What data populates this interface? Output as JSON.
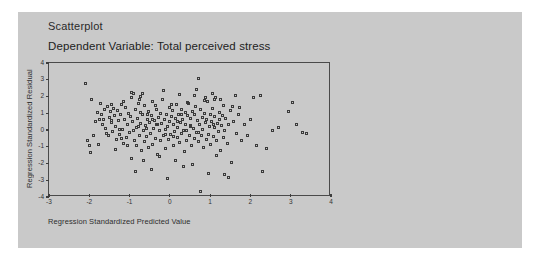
{
  "card": {
    "background": "#c9c9c9",
    "title": "Scatterplot",
    "subtitle": "Dependent Variable: Total perceived stress"
  },
  "chart_data": {
    "type": "scatter",
    "title": "Scatterplot",
    "subtitle": "Dependent Variable: Total perceived stress",
    "xlabel": "Regression Standardized Predicted Value",
    "ylabel": "Regression Standardized Residual",
    "xlim": [
      -3,
      4
    ],
    "ylim": [
      -4,
      4
    ],
    "xticks": [
      -3,
      -2,
      -1,
      0,
      1,
      2,
      3,
      4
    ],
    "yticks": [
      4,
      3,
      2,
      1,
      0,
      -1,
      -2,
      -3,
      -4
    ],
    "xtick_labels": [
      "-3",
      "-2",
      "-1",
      "0",
      "1",
      "2",
      "3",
      "4"
    ],
    "ytick_labels": [
      "4",
      "3",
      "2",
      "1",
      "0",
      "-1",
      "-2",
      "-3",
      "-4"
    ],
    "grid": false,
    "legend": false,
    "marker": "open-square",
    "marker_color": "#3a3a3a",
    "points": [
      [
        -2.1,
        2.8
      ],
      [
        -1.95,
        1.8
      ],
      [
        -1.8,
        1.05
      ],
      [
        -1.75,
        0.6
      ],
      [
        -1.7,
        0.95
      ],
      [
        -1.68,
        0.3
      ],
      [
        -1.62,
        1.25
      ],
      [
        -1.6,
        0.1
      ],
      [
        -1.55,
        1.4
      ],
      [
        -1.52,
        -0.35
      ],
      [
        -1.5,
        0.75
      ],
      [
        -1.48,
        1.1
      ],
      [
        -1.45,
        0.45
      ],
      [
        -1.42,
        -0.1
      ],
      [
        -1.4,
        1.3
      ],
      [
        -1.38,
        0.85
      ],
      [
        -1.35,
        0.2
      ],
      [
        -1.32,
        -0.55
      ],
      [
        -1.3,
        1.15
      ],
      [
        -1.28,
        0.55
      ],
      [
        -1.25,
        -0.25
      ],
      [
        -1.22,
        0.95
      ],
      [
        -1.2,
        1.55
      ],
      [
        -1.18,
        0.05
      ],
      [
        -1.15,
        -0.8
      ],
      [
        -1.12,
        0.65
      ],
      [
        -1.1,
        1.35
      ],
      [
        -1.08,
        -0.45
      ],
      [
        -1.05,
        0.35
      ],
      [
        -1.02,
        1.0
      ],
      [
        -1.0,
        -0.15
      ],
      [
        -0.98,
        0.8
      ],
      [
        -0.96,
        1.95
      ],
      [
        -0.95,
        -1.7
      ],
      [
        -0.92,
        0.5
      ],
      [
        -0.9,
        2.15
      ],
      [
        -0.88,
        -0.6
      ],
      [
        -0.86,
        1.2
      ],
      [
        -0.84,
        0.15
      ],
      [
        -0.82,
        -0.95
      ],
      [
        -0.8,
        0.7
      ],
      [
        -0.78,
        1.6
      ],
      [
        -0.76,
        -0.3
      ],
      [
        -0.74,
        0.4
      ],
      [
        -0.72,
        1.05
      ],
      [
        -0.7,
        -1.25
      ],
      [
        -0.68,
        0.9
      ],
      [
        -0.66,
        0.0
      ],
      [
        -0.64,
        -0.7
      ],
      [
        -0.62,
        1.45
      ],
      [
        -0.6,
        0.25
      ],
      [
        -0.58,
        -0.4
      ],
      [
        -0.56,
        0.6
      ],
      [
        -0.54,
        1.1
      ],
      [
        -0.52,
        -1.05
      ],
      [
        -0.5,
        0.45
      ],
      [
        -0.48,
        -0.2
      ],
      [
        -0.46,
        0.85
      ],
      [
        -0.44,
        1.7
      ],
      [
        -0.42,
        -0.85
      ],
      [
        -0.4,
        0.1
      ],
      [
        -0.38,
        0.55
      ],
      [
        -0.36,
        -0.5
      ],
      [
        -0.34,
        1.25
      ],
      [
        -0.32,
        0.3
      ],
      [
        -0.3,
        -1.45
      ],
      [
        -0.28,
        0.75
      ],
      [
        -0.26,
        -0.05
      ],
      [
        -0.24,
        1.0
      ],
      [
        -0.22,
        -0.65
      ],
      [
        -0.2,
        0.4
      ],
      [
        -0.18,
        1.8
      ],
      [
        -0.16,
        -0.35
      ],
      [
        -0.14,
        0.65
      ],
      [
        -0.12,
        0.05
      ],
      [
        -0.1,
        -1.1
      ],
      [
        -0.08,
        0.9
      ],
      [
        -0.06,
        0.2
      ],
      [
        -0.04,
        -0.55
      ],
      [
        -0.02,
        1.35
      ],
      [
        0.0,
        0.5
      ],
      [
        0.02,
        -0.25
      ],
      [
        0.04,
        0.8
      ],
      [
        0.06,
        1.15
      ],
      [
        0.08,
        -0.9
      ],
      [
        0.1,
        0.35
      ],
      [
        0.12,
        -0.1
      ],
      [
        0.14,
        0.7
      ],
      [
        0.16,
        1.5
      ],
      [
        0.18,
        -0.45
      ],
      [
        0.2,
        0.15
      ],
      [
        0.22,
        0.95
      ],
      [
        0.24,
        -0.75
      ],
      [
        0.26,
        0.45
      ],
      [
        0.28,
        1.25
      ],
      [
        0.3,
        -0.2
      ],
      [
        0.32,
        0.6
      ],
      [
        0.34,
        0.0
      ],
      [
        0.36,
        -1.3
      ],
      [
        0.38,
        1.05
      ],
      [
        0.4,
        0.3
      ],
      [
        0.42,
        -0.6
      ],
      [
        0.44,
        0.85
      ],
      [
        0.46,
        1.6
      ],
      [
        0.48,
        -0.35
      ],
      [
        0.5,
        0.25
      ],
      [
        0.52,
        0.7
      ],
      [
        0.54,
        -0.95
      ],
      [
        0.56,
        1.1
      ],
      [
        0.58,
        0.1
      ],
      [
        0.6,
        -0.5
      ],
      [
        0.62,
        0.9
      ],
      [
        0.64,
        1.4
      ],
      [
        0.66,
        -0.15
      ],
      [
        0.68,
        0.55
      ],
      [
        0.7,
        3.1
      ],
      [
        0.72,
        -0.7
      ],
      [
        0.74,
        0.35
      ],
      [
        0.76,
        1.2
      ],
      [
        0.78,
        -0.3
      ],
      [
        0.8,
        0.75
      ],
      [
        0.82,
        0.05
      ],
      [
        0.84,
        -1.05
      ],
      [
        0.86,
        1.0
      ],
      [
        0.88,
        0.45
      ],
      [
        0.9,
        -0.55
      ],
      [
        0.92,
        0.65
      ],
      [
        0.94,
        1.7
      ],
      [
        0.96,
        -0.25
      ],
      [
        0.98,
        0.2
      ],
      [
        1.0,
        0.95
      ],
      [
        1.02,
        -0.85
      ],
      [
        1.04,
        0.5
      ],
      [
        1.06,
        1.3
      ],
      [
        1.08,
        -0.4
      ],
      [
        1.1,
        0.15
      ],
      [
        1.12,
        0.8
      ],
      [
        1.14,
        1.95
      ],
      [
        1.16,
        -0.65
      ],
      [
        1.18,
        0.4
      ],
      [
        1.2,
        -0.1
      ],
      [
        1.22,
        1.05
      ],
      [
        1.24,
        0.6
      ],
      [
        1.26,
        -1.2
      ],
      [
        1.28,
        0.25
      ],
      [
        1.3,
        0.85
      ],
      [
        1.32,
        1.45
      ],
      [
        1.34,
        -0.45
      ],
      [
        1.36,
        0.0
      ],
      [
        1.38,
        0.7
      ],
      [
        1.42,
        -0.8
      ],
      [
        1.46,
        0.35
      ],
      [
        1.5,
        1.15
      ],
      [
        1.54,
        -1.95
      ],
      [
        1.58,
        0.5
      ],
      [
        1.62,
        2.05
      ],
      [
        1.66,
        -0.2
      ],
      [
        1.7,
        0.9
      ],
      [
        1.74,
        1.35
      ],
      [
        1.78,
        -0.6
      ],
      [
        1.85,
        0.3
      ],
      [
        1.92,
        -0.35
      ],
      [
        2.0,
        0.6
      ],
      [
        2.08,
        1.95
      ],
      [
        2.15,
        -0.95
      ],
      [
        2.25,
        2.05
      ],
      [
        2.3,
        -2.45
      ],
      [
        2.4,
        -1.1
      ],
      [
        2.55,
        -0.05
      ],
      [
        2.7,
        0.15
      ],
      [
        2.95,
        1.1
      ],
      [
        3.05,
        1.65
      ],
      [
        3.15,
        0.3
      ],
      [
        3.3,
        -0.15
      ],
      [
        3.38,
        -0.2
      ],
      [
        -1.9,
        -0.3
      ],
      [
        -1.85,
        0.5
      ],
      [
        -1.78,
        -0.85
      ],
      [
        -1.72,
        1.6
      ],
      [
        -1.65,
        0.65
      ],
      [
        -1.58,
        -0.2
      ],
      [
        -1.46,
        1.5
      ],
      [
        -1.36,
        -1.15
      ],
      [
        -1.26,
        0.05
      ],
      [
        -1.16,
        1.7
      ],
      [
        -1.06,
        -0.95
      ],
      [
        -0.94,
        2.25
      ],
      [
        -0.85,
        -2.5
      ],
      [
        -0.75,
        1.85
      ],
      [
        -0.65,
        -1.85
      ],
      [
        -0.55,
        0.95
      ],
      [
        -0.45,
        -2.35
      ],
      [
        -0.35,
        1.45
      ],
      [
        -0.25,
        -1.6
      ],
      [
        -0.15,
        2.35
      ],
      [
        -0.05,
        -2.9
      ],
      [
        0.05,
        1.55
      ],
      [
        0.15,
        -1.8
      ],
      [
        0.25,
        2.1
      ],
      [
        0.35,
        -2.2
      ],
      [
        0.45,
        1.65
      ],
      [
        0.55,
        -2.05
      ],
      [
        0.65,
        2.4
      ],
      [
        0.75,
        -3.7
      ],
      [
        0.85,
        1.75
      ],
      [
        0.95,
        -2.6
      ],
      [
        1.05,
        2.15
      ],
      [
        1.15,
        -1.5
      ],
      [
        1.25,
        1.85
      ],
      [
        1.35,
        -2.65
      ],
      [
        1.45,
        -2.85
      ],
      [
        1.55,
        1.4
      ],
      [
        -2.05,
        -0.6
      ],
      [
        -2.0,
        -0.9
      ],
      [
        -1.96,
        -1.35
      ],
      [
        -0.68,
        2.2
      ],
      [
        -0.72,
        2.0
      ],
      [
        0.62,
        2.05
      ],
      [
        0.88,
        1.95
      ],
      [
        1.12,
        1.8
      ],
      [
        -1.2,
        -0.5
      ],
      [
        -0.9,
        -0.05
      ],
      [
        0.42,
        -0.05
      ],
      [
        0.18,
        0.48
      ],
      [
        -0.3,
        0.35
      ],
      [
        0.08,
        -0.38
      ],
      [
        -0.58,
        0.08
      ],
      [
        0.7,
        -0.12
      ],
      [
        -0.12,
        -0.28
      ],
      [
        0.52,
        0.18
      ],
      [
        -0.42,
        0.62
      ],
      [
        0.3,
        0.95
      ],
      [
        -0.78,
        0.22
      ],
      [
        1.08,
        0.3
      ],
      [
        -1.44,
        0.58
      ]
    ]
  }
}
